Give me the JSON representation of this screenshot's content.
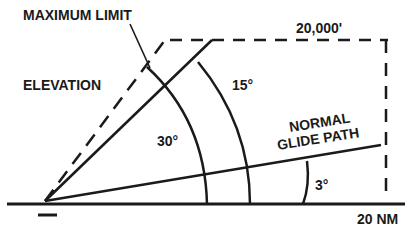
{
  "diagram": {
    "labels": {
      "maximum_limit": "MAXIMUM LIMIT",
      "elevation": "ELEVATION",
      "altitude": "20,000'",
      "angle_15": "15°",
      "angle_30": "30°",
      "normal_line1": "NORMAL",
      "normal_line2": "GLIDE PATH",
      "angle_3": "3°",
      "range": "20 NM"
    },
    "colors": {
      "ink": "#1a1a1a",
      "background": "#ffffff"
    }
  }
}
